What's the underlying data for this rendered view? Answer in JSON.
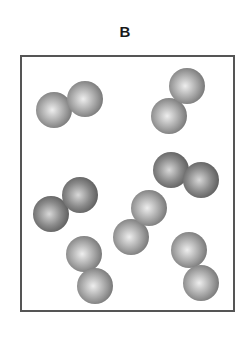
{
  "diagram": {
    "label": "B",
    "box": {
      "x": 20,
      "y": 55,
      "width": 215,
      "height": 257,
      "border_color": "#555555"
    },
    "molecule_type": "diatomic",
    "sphere_radius": 18,
    "colors": {
      "light": {
        "highlight": "#eeeeee",
        "mid": "#a8a8a8",
        "edge": "#6e6e6e"
      },
      "dark": {
        "highlight": "#d8d8d8",
        "mid": "#8a8a8a",
        "edge": "#555555"
      }
    },
    "molecules": [
      {
        "id": "molecule-1",
        "shade": "light",
        "atoms": [
          {
            "cx": 54,
            "cy": 110
          },
          {
            "cx": 85,
            "cy": 99
          }
        ]
      },
      {
        "id": "molecule-2",
        "shade": "light",
        "atoms": [
          {
            "cx": 169,
            "cy": 116
          },
          {
            "cx": 187,
            "cy": 86
          }
        ]
      },
      {
        "id": "molecule-3",
        "shade": "dark",
        "atoms": [
          {
            "cx": 171,
            "cy": 170
          },
          {
            "cx": 201,
            "cy": 180
          }
        ]
      },
      {
        "id": "molecule-4",
        "shade": "dark",
        "atoms": [
          {
            "cx": 51,
            "cy": 214
          },
          {
            "cx": 80,
            "cy": 195
          }
        ]
      },
      {
        "id": "molecule-5",
        "shade": "light",
        "atoms": [
          {
            "cx": 131,
            "cy": 237
          },
          {
            "cx": 149,
            "cy": 208
          }
        ]
      },
      {
        "id": "molecule-6",
        "shade": "light",
        "atoms": [
          {
            "cx": 84,
            "cy": 254
          },
          {
            "cx": 95,
            "cy": 286
          }
        ]
      },
      {
        "id": "molecule-7",
        "shade": "light",
        "atoms": [
          {
            "cx": 189,
            "cy": 250
          },
          {
            "cx": 201,
            "cy": 283
          }
        ]
      }
    ]
  }
}
